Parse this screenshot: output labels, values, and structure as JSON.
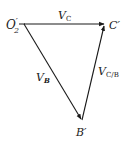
{
  "diagram": {
    "type": "velocity-polygon",
    "points": {
      "origin": {
        "label": "O",
        "prime": "′",
        "sub": "2",
        "x": 24,
        "y": 24
      },
      "c": {
        "label": "C′",
        "x": 105,
        "y": 24
      },
      "b": {
        "label": "B′",
        "x": 82,
        "y": 120
      }
    },
    "vectors": [
      {
        "name": "V_C",
        "label": "V",
        "sub": "C",
        "from": "origin",
        "to": "c"
      },
      {
        "name": "V_B",
        "label": "V",
        "sub": "B",
        "from": "origin",
        "to": "b"
      },
      {
        "name": "V_C/B",
        "label": "V",
        "sub": "C/B",
        "from": "b",
        "to": "c"
      }
    ],
    "line_color": "#1a1a1a"
  }
}
